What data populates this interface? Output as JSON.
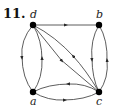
{
  "problem": {
    "number": "11."
  },
  "nodes": [
    {
      "id": "d",
      "label": "d",
      "x": 33,
      "y": 25
    },
    {
      "id": "b",
      "label": "b",
      "x": 99,
      "y": 25
    },
    {
      "id": "a",
      "label": "a",
      "x": 33,
      "y": 92
    },
    {
      "id": "c",
      "label": "c",
      "x": 99,
      "y": 92
    }
  ],
  "edges": [
    {
      "from": "d",
      "to": "b",
      "shape": "straight"
    },
    {
      "from": "d",
      "to": "a",
      "shape": "curved-left"
    },
    {
      "from": "a",
      "to": "d",
      "shape": "curved-right"
    },
    {
      "from": "b",
      "to": "c",
      "shape": "curved-left"
    },
    {
      "from": "c",
      "to": "b",
      "shape": "curved-right"
    },
    {
      "from": "c",
      "to": "a",
      "shape": "curved-top"
    },
    {
      "from": "a",
      "to": "c",
      "shape": "curved-bottom"
    },
    {
      "from": "d",
      "to": "c",
      "shape": "straight"
    },
    {
      "from": "c",
      "to": "d",
      "shape": "curved"
    }
  ],
  "colors": {
    "stroke": "#333333",
    "node": "#000000"
  }
}
